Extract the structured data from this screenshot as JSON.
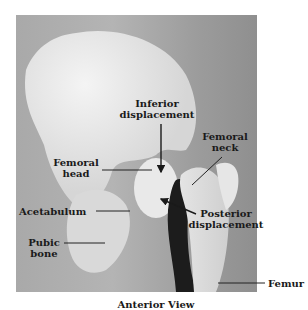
{
  "figure": {
    "view_caption": "Anterior View",
    "labels": {
      "inferior_displacement": [
        "Inferior",
        "displacement"
      ],
      "femoral_neck": [
        "Femoral",
        "neck"
      ],
      "femoral_head": [
        "Femoral",
        "head"
      ],
      "acetabulum": "Acetabulum",
      "posterior_displacement": [
        "Posterior",
        "displacement"
      ],
      "pubic_bone": [
        "Pubic",
        "bone"
      ],
      "femur": "Femur"
    },
    "colors": {
      "background": "#ffffff",
      "photo_background": "#a9a9a9",
      "bone": "#ececec",
      "shadow": "#1c1c1c",
      "label_text": "#1a1a1a"
    }
  }
}
